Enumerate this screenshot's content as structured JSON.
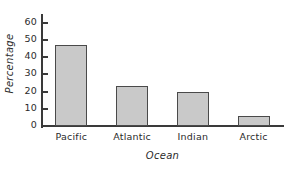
{
  "chart_data": {
    "type": "bar",
    "title": "",
    "subtitle": "",
    "xlabel": "Ocean",
    "ylabel": "Percentage",
    "categories": [
      "Pacific",
      "Atlantic",
      "Indian",
      "Arctic"
    ],
    "values": [
      47,
      23.5,
      19.5,
      6
    ],
    "ylim": [
      0,
      65
    ],
    "yticks": [
      0,
      10,
      20,
      30,
      40,
      50,
      60
    ],
    "ytick_labels": [
      "0",
      "10",
      "20",
      "30",
      "40",
      "50",
      "60"
    ],
    "grid": false,
    "legend": null,
    "series": [
      {
        "name": "Percentage",
        "values": [
          47,
          23.5,
          19.5,
          6
        ]
      }
    ],
    "annotations": []
  },
  "style": {
    "bar_fill": "#c9c9c9",
    "bar_stroke": "#4a4a4a",
    "axis_color": "#3a3a3a",
    "text_color": "#2b2b2b",
    "background": "#ffffff"
  }
}
